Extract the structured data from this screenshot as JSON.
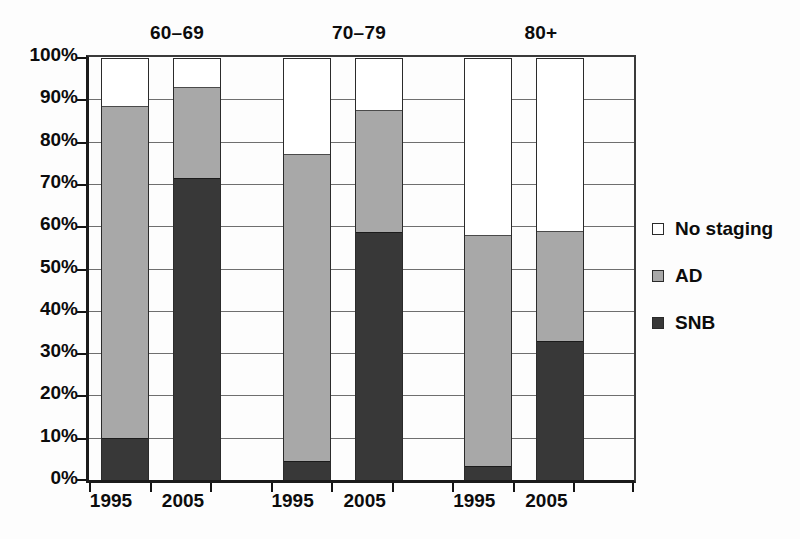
{
  "chart_data": {
    "type": "bar",
    "subtype": "stacked-percentage-grouped",
    "title": "",
    "xlabel": "",
    "ylabel": "",
    "ylim": [
      0,
      100
    ],
    "ytick_labels": [
      "0%",
      "10%",
      "20%",
      "30%",
      "40%",
      "50%",
      "60%",
      "70%",
      "80%",
      "90%",
      "100%"
    ],
    "ytick_values": [
      0,
      10,
      20,
      30,
      40,
      50,
      60,
      70,
      80,
      90,
      100
    ],
    "grid": true,
    "legend_position": "right",
    "legend": [
      {
        "label": "No staging",
        "color": "#ffffff"
      },
      {
        "label": "AD",
        "color": "#a8a8a8"
      },
      {
        "label": "SNB",
        "color": "#383838"
      }
    ],
    "series": [
      {
        "name": "SNB",
        "color": "#383838",
        "values": [
          9.9,
          71.3,
          4.4,
          58.7,
          3.2,
          32.9
        ]
      },
      {
        "name": "AD",
        "color": "#a8a8a8",
        "values": [
          78.6,
          21.7,
          72.6,
          28.8,
          54.8,
          25.9
        ]
      },
      {
        "name": "No staging",
        "color": "#ffffff",
        "values": [
          11.5,
          7.0,
          23.0,
          12.5,
          42.0,
          41.2
        ]
      }
    ],
    "group_labels": [
      "60–69",
      "70–79",
      "80+"
    ],
    "categories": [
      "1995",
      "2005",
      "1995",
      "2005",
      "1995",
      "2005"
    ],
    "bars": [
      {
        "group": "60–69",
        "year": "1995",
        "snb": 9.9,
        "ad": 88.5,
        "total": 100
      },
      {
        "group": "60–69",
        "year": "2005",
        "snb": 71.3,
        "ad": 93.0,
        "total": 100
      },
      {
        "group": "70–79",
        "year": "1995",
        "snb": 4.4,
        "ad": 77.0,
        "total": 100
      },
      {
        "group": "70–79",
        "year": "2005",
        "snb": 58.7,
        "ad": 87.5,
        "total": 100
      },
      {
        "group": "80+",
        "year": "1995",
        "snb": 3.2,
        "ad": 58.0,
        "total": 100
      },
      {
        "group": "80+",
        "year": "2005",
        "snb": 32.9,
        "ad": 58.8,
        "total": 100
      }
    ]
  }
}
